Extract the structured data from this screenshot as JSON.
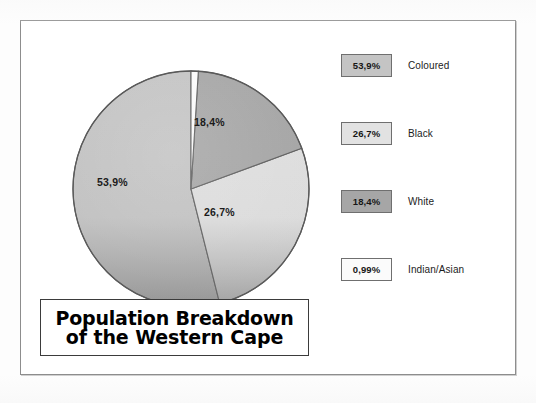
{
  "chart_data": {
    "type": "pie",
    "title": "Population Breakdown of the Western Cape",
    "title_lines": [
      "Population Breakdown",
      "of the Western Cape"
    ],
    "categories": [
      "Coloured",
      "Black",
      "White",
      "Indian/Asian"
    ],
    "values": [
      53.9,
      26.7,
      18.4,
      0.99
    ],
    "value_labels": [
      "53,9%",
      "26,7%",
      "18,4%",
      "0,99%"
    ],
    "colors": [
      "#c4c4c4",
      "#e0e0e0",
      "#a6a6a6",
      "#fbfbfb"
    ],
    "slice_order_clockwise_from_top": [
      "Indian/Asian",
      "White",
      "Black",
      "Coloured"
    ],
    "labels_on_slices": [
      "18,4%",
      "26,7%",
      "53,9%"
    ],
    "legend_position": "right",
    "grid": false,
    "xlabel": "",
    "ylabel": ""
  },
  "title": {
    "line1": "Population Breakdown",
    "line2": "of the Western Cape"
  },
  "pie": {
    "labels": {
      "white": "18,4%",
      "black": "26,7%",
      "coloured": "53,9%"
    }
  },
  "legend": {
    "items": [
      {
        "value": "53,9%",
        "label": "Coloured",
        "color": "#c4c4c4"
      },
      {
        "value": "26,7%",
        "label": "Black",
        "color": "#e0e0e0"
      },
      {
        "value": "18,4%",
        "label": "White",
        "color": "#a6a6a6"
      },
      {
        "value": "0,99%",
        "label": "Indian/Asian",
        "color": "#fbfbfb"
      }
    ]
  }
}
